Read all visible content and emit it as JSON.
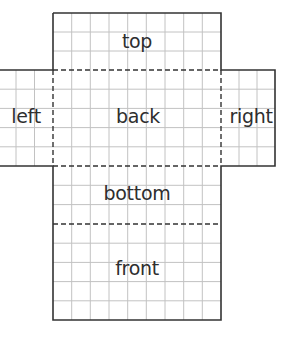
{
  "diagram": {
    "type": "cube-net",
    "grid": {
      "cell_width": 18.67,
      "cell_height": 19.2,
      "grid_color": "#bdbdbd",
      "outline_color": "#333333",
      "fold_line_color": "#333333",
      "fold_line_style": "dashed"
    },
    "faces": [
      {
        "id": "top",
        "label": "top",
        "x": 53,
        "y": 13,
        "w": 168,
        "h": 57
      },
      {
        "id": "left",
        "label": "left",
        "x": 0,
        "y": 70,
        "w": 53,
        "h": 96
      },
      {
        "id": "back",
        "label": "back",
        "x": 53,
        "y": 70,
        "w": 168,
        "h": 96
      },
      {
        "id": "right",
        "label": "right",
        "x": 221,
        "y": 70,
        "w": 54,
        "h": 96
      },
      {
        "id": "bottom",
        "label": "bottom",
        "x": 53,
        "y": 166,
        "w": 168,
        "h": 58
      },
      {
        "id": "front",
        "label": "front",
        "x": 53,
        "y": 224,
        "w": 168,
        "h": 96
      }
    ],
    "labels": {
      "top": "top",
      "left": "left",
      "back": "back",
      "right": "right",
      "bottom": "bottom",
      "front": "front"
    }
  }
}
